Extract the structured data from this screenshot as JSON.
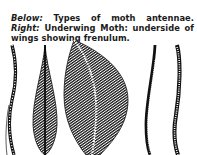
{
  "caption": {
    "label_below": "Below:",
    "text_below": " Types of moth antennae. ",
    "label_right": "Right:",
    "text_right": " Underwing Moth: underside of wings showing frenulum."
  },
  "figure": {
    "description": "Types of moth antennae",
    "antennae": [
      {
        "type": "simple-segmented",
        "x": 14
      },
      {
        "type": "bipectinate-narrow",
        "x": 45
      },
      {
        "type": "bipectinate-broad-plumose",
        "x": 95
      },
      {
        "type": "filiform",
        "x": 151
      },
      {
        "type": "serrate-segmented",
        "x": 177
      }
    ]
  }
}
